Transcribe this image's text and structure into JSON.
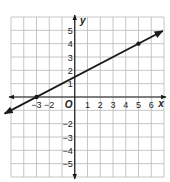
{
  "chart_data": {
    "type": "line",
    "title": "",
    "xlabel": "x",
    "ylabel": "y",
    "origin_label": "O",
    "xlim": [
      -5,
      7
    ],
    "ylim": [
      -6,
      6
    ],
    "grid": true,
    "x_tick_labels": [
      "-3",
      "-2",
      "1",
      "2",
      "3",
      "4",
      "5",
      "6"
    ],
    "x_tick_values": [
      -3,
      -2,
      1,
      2,
      3,
      4,
      5,
      6
    ],
    "y_tick_labels": [
      "5",
      "4",
      "3",
      "2",
      "1",
      "-2",
      "-3",
      "-4",
      "-5"
    ],
    "y_tick_values": [
      5,
      4,
      3,
      2,
      1,
      -2,
      -3,
      -4,
      -5
    ],
    "series": [
      {
        "name": "line",
        "points": [
          {
            "x": -3,
            "y": 0
          },
          {
            "x": 5,
            "y": 4
          }
        ],
        "slope": 0.5,
        "intercept": 1.5,
        "arrows_both_ends": true
      }
    ],
    "colors": {
      "grid": "#b8b8b8",
      "axis": "#1a1a1a",
      "line": "#1a1a1a"
    }
  }
}
